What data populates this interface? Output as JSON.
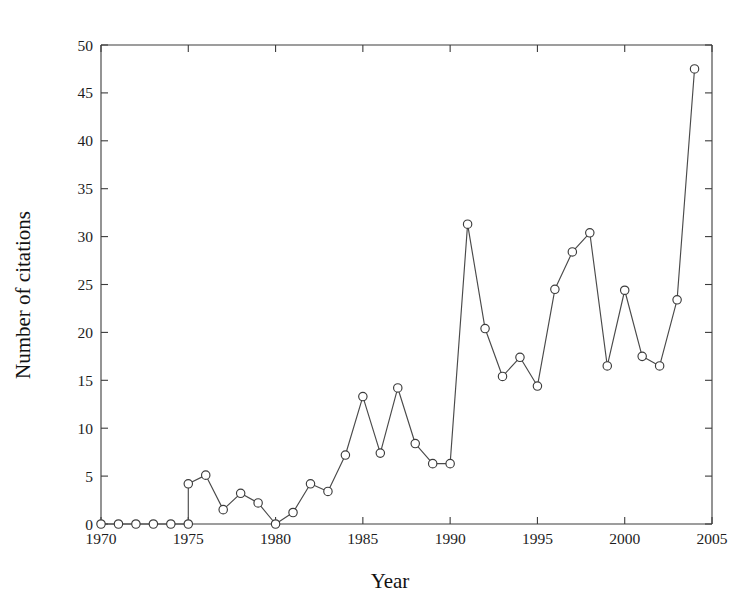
{
  "chart_data": {
    "type": "line",
    "title": "",
    "xlabel": "Year",
    "ylabel": "Number of citations",
    "xlim": [
      1970,
      2005
    ],
    "ylim": [
      0,
      50
    ],
    "xticks": [
      1970,
      1975,
      1980,
      1985,
      1990,
      1995,
      2000,
      2005
    ],
    "xtick_labels": [
      "1970",
      "1975",
      "1980",
      "1985",
      "1990",
      "1995",
      "2000",
      "2005"
    ],
    "yticks": [
      0,
      5,
      10,
      15,
      20,
      25,
      30,
      35,
      40,
      45,
      50
    ],
    "ytick_labels": [
      "0",
      "5",
      "10",
      "15",
      "20",
      "25",
      "30",
      "35",
      "40",
      "45",
      "50"
    ],
    "grid": false,
    "legend": false,
    "marker": "open-circle",
    "line_color": "#4a4a4a",
    "marker_face_color": "#ffffff",
    "marker_edge_color": "#3c3c3c",
    "x": [
      1970,
      1971,
      1972,
      1973,
      1974,
      1975,
      1975,
      1976,
      1977,
      1978,
      1979,
      1980,
      1981,
      1982,
      1983,
      1984,
      1985,
      1986,
      1987,
      1988,
      1989,
      1990,
      1991,
      1992,
      1993,
      1994,
      1995,
      1996,
      1997,
      1998,
      1999,
      2000,
      2001,
      2002,
      2003,
      2004
    ],
    "values": [
      0,
      0,
      0,
      0,
      0,
      0,
      4.2,
      5.1,
      1.5,
      3.2,
      2.2,
      0,
      1.2,
      4.2,
      3.4,
      7.2,
      13.3,
      7.4,
      14.2,
      8.4,
      6.3,
      6.3,
      31.3,
      20.4,
      15.4,
      17.4,
      14.4,
      24.5,
      28.4,
      30.4,
      16.5,
      24.4,
      17.5,
      16.5,
      23.4,
      47.5
    ],
    "series": [
      {
        "name": "citations",
        "points": [
          {
            "x": 1970,
            "y": 0
          },
          {
            "x": 1971,
            "y": 0
          },
          {
            "x": 1972,
            "y": 0
          },
          {
            "x": 1973,
            "y": 0
          },
          {
            "x": 1974,
            "y": 0
          },
          {
            "x": 1975,
            "y": 0
          },
          {
            "x": 1975,
            "y": 4.2
          },
          {
            "x": 1976,
            "y": 5.1
          },
          {
            "x": 1977,
            "y": 1.5
          },
          {
            "x": 1978,
            "y": 3.2
          },
          {
            "x": 1979,
            "y": 2.2
          },
          {
            "x": 1980,
            "y": 0
          },
          {
            "x": 1981,
            "y": 1.2
          },
          {
            "x": 1982,
            "y": 4.2
          },
          {
            "x": 1983,
            "y": 3.4
          },
          {
            "x": 1984,
            "y": 7.2
          },
          {
            "x": 1985,
            "y": 13.3
          },
          {
            "x": 1986,
            "y": 7.4
          },
          {
            "x": 1987,
            "y": 14.2
          },
          {
            "x": 1988,
            "y": 8.4
          },
          {
            "x": 1989,
            "y": 6.3
          },
          {
            "x": 1990,
            "y": 6.3
          },
          {
            "x": 1991,
            "y": 31.3
          },
          {
            "x": 1992,
            "y": 20.4
          },
          {
            "x": 1993,
            "y": 15.4
          },
          {
            "x": 1994,
            "y": 17.4
          },
          {
            "x": 1995,
            "y": 14.4
          },
          {
            "x": 1996,
            "y": 24.5
          },
          {
            "x": 1997,
            "y": 28.4
          },
          {
            "x": 1998,
            "y": 30.4
          },
          {
            "x": 1999,
            "y": 16.5
          },
          {
            "x": 2000,
            "y": 24.4
          },
          {
            "x": 2001,
            "y": 17.5
          },
          {
            "x": 2002,
            "y": 16.5
          },
          {
            "x": 2003,
            "y": 23.4
          },
          {
            "x": 2004,
            "y": 47.5
          }
        ]
      }
    ]
  }
}
